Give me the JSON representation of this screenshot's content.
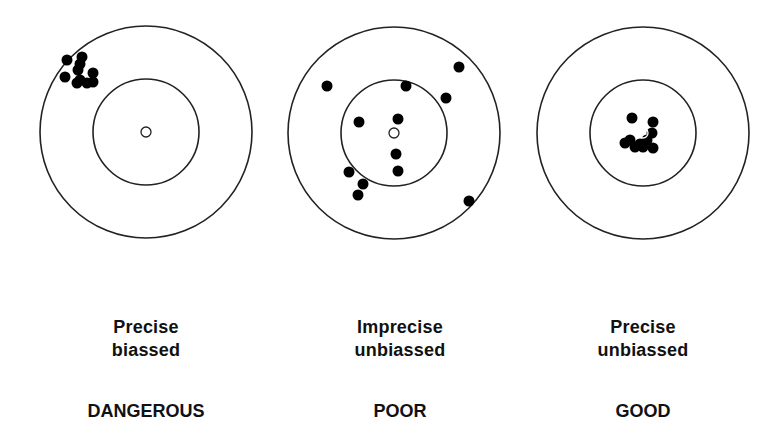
{
  "colors": {
    "ring_stroke": "#222222",
    "shot_fill": "#000000",
    "bullseye_fill": "#ffffff",
    "text": "#111111"
  },
  "targets": [
    {
      "id": "left",
      "center": [
        146,
        132
      ],
      "outer_radius": 106,
      "inner_radius": 53,
      "bullseye_radius": 5,
      "description": [
        "Precise",
        "biassed"
      ],
      "verdict": "DANGEROUS",
      "shots": [
        [
          67,
          60
        ],
        [
          82,
          57
        ],
        [
          80,
          64
        ],
        [
          65,
          77
        ],
        [
          78,
          70
        ],
        [
          80,
          80
        ],
        [
          93,
          73
        ],
        [
          93,
          82
        ],
        [
          87,
          83
        ],
        [
          77,
          83
        ]
      ]
    },
    {
      "id": "middle",
      "center": [
        394,
        133
      ],
      "outer_radius": 106,
      "inner_radius": 53,
      "bullseye_radius": 5,
      "description": [
        "Imprecise",
        "unbiassed"
      ],
      "verdict": "POOR",
      "shots": [
        [
          327,
          86
        ],
        [
          406,
          86
        ],
        [
          459,
          67
        ],
        [
          446,
          98
        ],
        [
          359,
          122
        ],
        [
          398,
          119
        ],
        [
          396,
          154
        ],
        [
          398,
          171
        ],
        [
          349,
          172
        ],
        [
          363,
          184
        ],
        [
          358,
          195
        ],
        [
          469,
          201
        ]
      ]
    },
    {
      "id": "right",
      "center": [
        643,
        133
      ],
      "outer_radius": 106,
      "inner_radius": 53,
      "bullseye_radius": 5,
      "description": [
        "Precise",
        "unbiassed"
      ],
      "verdict": "GOOD",
      "shots": [
        [
          632,
          118
        ],
        [
          653,
          122
        ],
        [
          652,
          133
        ],
        [
          647,
          140
        ],
        [
          630,
          140
        ],
        [
          635,
          147
        ],
        [
          643,
          147
        ],
        [
          653,
          148
        ],
        [
          625,
          143
        ],
        [
          640,
          144
        ]
      ]
    }
  ]
}
